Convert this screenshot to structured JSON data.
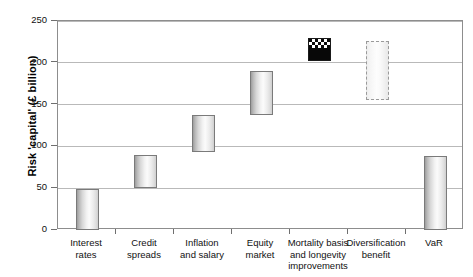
{
  "chart_data": {
    "type": "bar",
    "chart_style": "floating-waterfall",
    "title": "",
    "xlabel": "",
    "ylabel": "Risk 'capital' (£ billion)",
    "ylim": [
      0,
      250
    ],
    "yticks": [
      0,
      50,
      100,
      150,
      200,
      250
    ],
    "ytick_labels": [
      "0",
      "50",
      "100",
      "150",
      "200",
      "250"
    ],
    "grid": "horizontal",
    "legend": "none",
    "categories": [
      "Interest rates",
      "Credit spreads",
      "Inflation and salary",
      "Equity market",
      "Mortality basis and longevity improvements",
      "Diversification benefit",
      "VaR"
    ],
    "category_labels_wrapped": [
      "Interest\nrates",
      "Credit\nspreads",
      "Inflation\nand salary",
      "Equity\nmarket",
      "Mortality basis\nand longevity\nimprovements",
      "Diversification\nbenefit",
      "VaR"
    ],
    "bars": [
      {
        "category": "Interest rates",
        "bottom": 0,
        "top": 49,
        "height": 49,
        "style": "gradient-grey",
        "fill": "#eeeeee",
        "border": "#7a7a7a"
      },
      {
        "category": "Credit spreads",
        "bottom": 50,
        "top": 90,
        "height": 40,
        "style": "gradient-grey",
        "fill": "#eeeeee",
        "border": "#7a7a7a"
      },
      {
        "category": "Inflation and salary",
        "bottom": 93,
        "top": 138,
        "height": 45,
        "style": "gradient-grey",
        "fill": "#eeeeee",
        "border": "#7a7a7a"
      },
      {
        "category": "Equity market",
        "bottom": 138,
        "top": 190,
        "height": 52,
        "style": "gradient-grey",
        "fill": "#eeeeee",
        "border": "#7a7a7a"
      },
      {
        "category": "Mortality basis and longevity improvements",
        "bottom": 202,
        "top": 230,
        "height": 28,
        "style": "black-checker-top",
        "fill": "#080808",
        "border": "#1a1a1a"
      },
      {
        "category": "Diversification benefit",
        "bottom": 155,
        "top": 226,
        "height": 71,
        "style": "dashed-outline",
        "fill": "#f7f7f7",
        "border": "#9a9a9a"
      },
      {
        "category": "VaR",
        "bottom": 0,
        "top": 88,
        "height": 88,
        "style": "gradient-grey",
        "fill": "#eeeeee",
        "border": "#7a7a7a"
      }
    ]
  },
  "colors": {
    "plot_border": "#8d8d8d",
    "gridline": "#b9b9b9",
    "axis_text": "#111111",
    "background": "#ffffff"
  }
}
